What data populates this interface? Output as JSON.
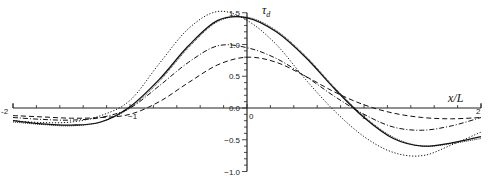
{
  "chart_data": {
    "type": "line",
    "title": "",
    "xlabel": "x/L",
    "ylabel": "τ_d",
    "xlim": [
      -2,
      2
    ],
    "ylim": [
      -1.0,
      1.5
    ],
    "grid": false,
    "legend": null,
    "x_ticks": [
      "-2",
      "-1",
      "0",
      "1",
      "2"
    ],
    "y_ticks": [
      "-1.0",
      "-0.5",
      "0.0",
      "0.5",
      "1.0",
      "1.5"
    ],
    "x": [
      -2.0,
      -1.75,
      -1.5,
      -1.25,
      -1.0,
      -0.75,
      -0.5,
      -0.25,
      0.0,
      0.25,
      0.5,
      0.75,
      1.0,
      1.25,
      1.5,
      1.75,
      2.0
    ],
    "series": [
      {
        "name": "solid",
        "style": "solid",
        "values": [
          -0.2,
          -0.25,
          -0.27,
          -0.22,
          0.02,
          0.45,
          0.98,
          1.38,
          1.42,
          1.2,
          0.8,
          0.3,
          -0.15,
          -0.48,
          -0.6,
          -0.55,
          -0.45
        ]
      },
      {
        "name": "fine-dotted",
        "style": "dotted-fine",
        "values": [
          -0.22,
          -0.26,
          -0.28,
          -0.22,
          0.0,
          0.42,
          0.95,
          1.36,
          1.43,
          1.22,
          0.82,
          0.32,
          -0.13,
          -0.46,
          -0.6,
          -0.56,
          -0.48
        ]
      },
      {
        "name": "dotted",
        "style": "dotted",
        "values": [
          -0.2,
          -0.23,
          -0.22,
          -0.12,
          0.12,
          0.7,
          1.25,
          1.52,
          1.38,
          1.0,
          0.45,
          -0.05,
          -0.45,
          -0.7,
          -0.75,
          -0.58,
          -0.38
        ]
      },
      {
        "name": "dash-dot",
        "style": "dashdot",
        "values": [
          -0.15,
          -0.18,
          -0.19,
          -0.15,
          0.0,
          0.35,
          0.72,
          0.98,
          0.95,
          0.78,
          0.5,
          0.18,
          -0.1,
          -0.3,
          -0.35,
          -0.28,
          -0.15
        ]
      },
      {
        "name": "dashed",
        "style": "dashed",
        "values": [
          -0.12,
          -0.14,
          -0.16,
          -0.15,
          -0.1,
          0.1,
          0.4,
          0.68,
          0.8,
          0.72,
          0.5,
          0.25,
          0.05,
          -0.08,
          -0.15,
          -0.17,
          -0.15
        ]
      }
    ]
  }
}
